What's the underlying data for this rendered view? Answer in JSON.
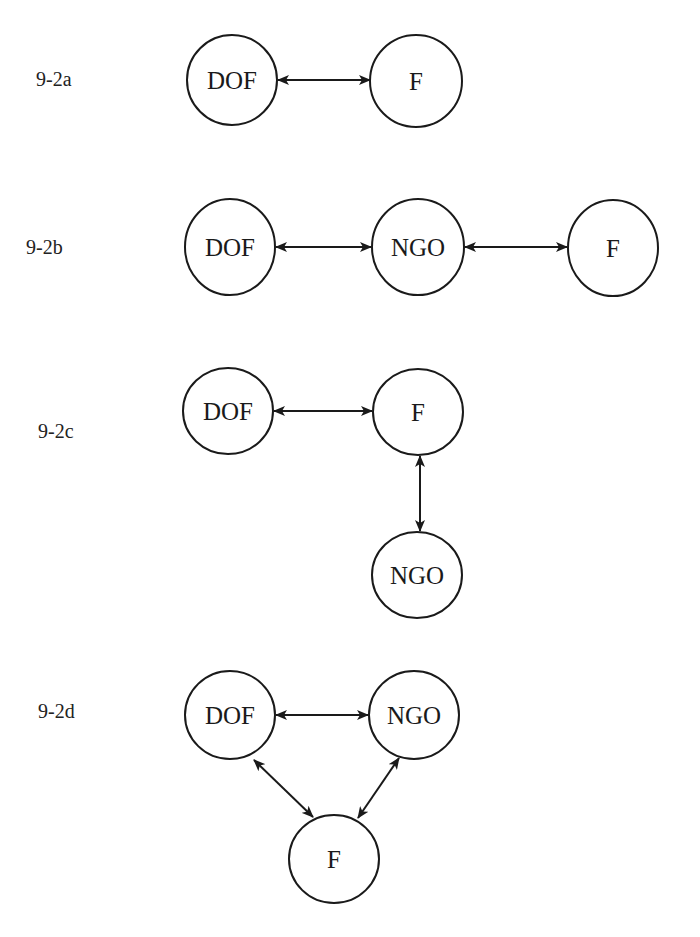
{
  "diagrams": [
    {
      "id": "9-2a",
      "label": "9-2a",
      "label_pos": [
        36,
        90
      ],
      "nodes": [
        {
          "name": "DOF",
          "cx": 232,
          "cy": 80,
          "rx": 45,
          "ry": 45
        },
        {
          "name": "F",
          "cx": 416,
          "cy": 81,
          "rx": 46,
          "ry": 46
        }
      ],
      "edges": [
        {
          "from": "DOF",
          "to": "F",
          "type": "bidirectional",
          "x1": 278,
          "y1": 80,
          "x2": 370,
          "y2": 80
        }
      ]
    },
    {
      "id": "9-2b",
      "label": "9-2b",
      "label_pos": [
        26,
        258
      ],
      "nodes": [
        {
          "name": "DOF",
          "cx": 230,
          "cy": 247,
          "rx": 45,
          "ry": 48
        },
        {
          "name": "NGO",
          "cx": 418,
          "cy": 247,
          "rx": 46,
          "ry": 48
        },
        {
          "name": "F",
          "cx": 613,
          "cy": 248,
          "rx": 45,
          "ry": 48
        }
      ],
      "edges": [
        {
          "from": "DOF",
          "to": "NGO",
          "type": "bidirectional",
          "x1": 276,
          "y1": 247,
          "x2": 371,
          "y2": 247
        },
        {
          "from": "NGO",
          "to": "F",
          "type": "bidirectional",
          "x1": 465,
          "y1": 247,
          "x2": 567,
          "y2": 247
        }
      ]
    },
    {
      "id": "9-2c",
      "label": "9-2c",
      "label_pos": [
        38,
        442
      ],
      "nodes": [
        {
          "name": "DOF",
          "cx": 228,
          "cy": 411,
          "rx": 45,
          "ry": 43
        },
        {
          "name": "F",
          "cx": 418,
          "cy": 412,
          "rx": 45,
          "ry": 43
        },
        {
          "name": "NGO",
          "cx": 417,
          "cy": 575,
          "rx": 45,
          "ry": 43
        }
      ],
      "edges": [
        {
          "from": "DOF",
          "to": "F",
          "type": "bidirectional",
          "x1": 274,
          "y1": 411,
          "x2": 372,
          "y2": 411
        },
        {
          "from": "F",
          "to": "NGO",
          "type": "bidirectional",
          "x1": 420,
          "y1": 456,
          "x2": 420,
          "y2": 531
        }
      ]
    },
    {
      "id": "9-2d",
      "label": "9-2d",
      "label_pos": [
        38,
        722
      ],
      "nodes": [
        {
          "name": "DOF",
          "cx": 230,
          "cy": 715,
          "rx": 45,
          "ry": 44
        },
        {
          "name": "NGO",
          "cx": 414,
          "cy": 715,
          "rx": 45,
          "ry": 44
        },
        {
          "name": "F",
          "cx": 334,
          "cy": 859,
          "rx": 45,
          "ry": 44
        }
      ],
      "edges": [
        {
          "from": "DOF",
          "to": "NGO",
          "type": "bidirectional",
          "x1": 276,
          "y1": 715,
          "x2": 368,
          "y2": 715
        },
        {
          "from": "DOF",
          "to": "F",
          "type": "bidirectional",
          "x1": 254,
          "y1": 760,
          "x2": 313,
          "y2": 817
        },
        {
          "from": "NGO",
          "to": "F",
          "type": "bidirectional",
          "x1": 399,
          "y1": 758,
          "x2": 358,
          "y2": 818
        }
      ]
    }
  ],
  "colors": {
    "stroke": "#1a1a1a",
    "background": "#ffffff",
    "text": "#1a1a1a"
  }
}
